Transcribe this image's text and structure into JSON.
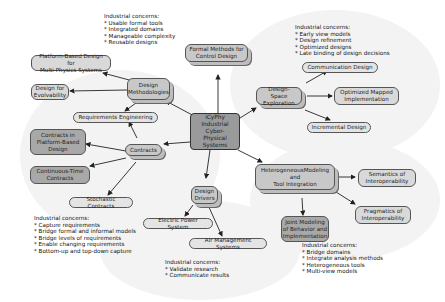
{
  "center": {
    "label": "iCyPhy\nIndustrial\nCyber-Physical\nSystems"
  },
  "hubs": {
    "design_methodologies": "Design\nMethodologies",
    "formal_methods": "Formal Methods for\nControl Design",
    "design_space": "Design-Space\nExploration",
    "contracts": "Contracts",
    "design_drivers": "Design\nDrivers",
    "heterogeneous": "HeterogeneousModeling\nand\nTool Integration"
  },
  "leaves": {
    "platform_multiphysics": "Platform-Based Design for\nMulti-Physics Systems",
    "evolvability": "Design for\nEvolvability",
    "requirements": "Requirements Engineering",
    "contracts_platform": "Contracts in\nPlatform-Based\nDesign",
    "continuous_time": "Continuous-Time\nContracts",
    "stochastic": "Stochastic Contracts",
    "communication": "Communication Design",
    "optimized_mapped": "Optimized Mapped\nImplementation",
    "incremental": "Incremental Design",
    "semantics": "Semantics of\nInteroperability",
    "pragmatics": "Pragmatics of\nInteroperability",
    "joint_modeling": "Joint Modeling\nof Behavior and\nImplementation",
    "electric_power": "Electric Power System",
    "air_management": "Air Management Systems"
  },
  "concerns": {
    "methodologies": {
      "title": "Industrial concerns:",
      "items": [
        "* Usable formal tools",
        "* Integrated domains",
        "* Manageable complexity",
        "* Reusable designs"
      ]
    },
    "design_space": {
      "title": "Industrial concerns:",
      "items": [
        "* Early view models",
        "* Design refinement",
        "* Optimized designs",
        "* Late binding of design decisions"
      ]
    },
    "contracts": {
      "title": "Industrial concerns:",
      "items": [
        "* Capture requirements",
        "* Bridge formal and informal models",
        "* Bridge levels of requirements",
        "* Enable changing requirements",
        "* Bottom-up and top-down capture"
      ]
    },
    "drivers": {
      "title": "Industrial concerns:",
      "items": [
        "* Validate research",
        "* Communicate results"
      ]
    },
    "heterogeneous": {
      "title": "Industrial concerns:",
      "items": [
        "* Bridge domains",
        "* Integrate analysis methods",
        "* Heterogeneous tools",
        "* Multi-view models"
      ]
    }
  }
}
